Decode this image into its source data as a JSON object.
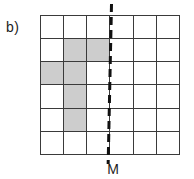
{
  "figure": {
    "label": "b)",
    "mirror_label": "M"
  },
  "chart_data": {
    "type": "grid-diagram",
    "rows": 6,
    "cols": 6,
    "shaded_cells": [
      [
        2,
        2
      ],
      [
        2,
        3
      ],
      [
        3,
        1
      ],
      [
        3,
        2
      ],
      [
        4,
        2
      ],
      [
        5,
        2
      ]
    ],
    "mirror_line": {
      "label": "M",
      "orientation": "vertical",
      "position": "between column 3 and column 4",
      "style": "dashed",
      "extends_beyond_grid": true
    }
  },
  "colors": {
    "background": "#ffffff",
    "grid_line": "#3a3a3a",
    "shaded_fill": "#cdcdcd",
    "mirror_line": "#111111"
  }
}
